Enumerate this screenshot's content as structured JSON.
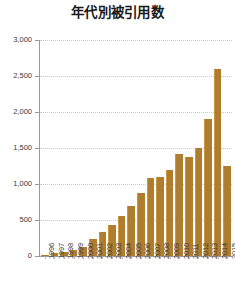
{
  "chart_data": {
    "type": "bar",
    "title": "年代別被引用数",
    "xlabel": "",
    "ylabel": "",
    "categories": [
      "1996",
      "1997",
      "1998",
      "1999",
      "2000",
      "2001",
      "2002",
      "2003",
      "2004",
      "2005",
      "2006",
      "2007",
      "2008",
      "2009",
      "2010",
      "2011",
      "2012",
      "2013",
      "2014",
      "2015"
    ],
    "values": [
      20,
      40,
      60,
      90,
      130,
      230,
      330,
      430,
      560,
      700,
      870,
      1080,
      1100,
      1200,
      1420,
      1380,
      1500,
      1900,
      2600,
      1250
    ],
    "series": [
      {
        "name": "被引用数",
        "values": [
          20,
          40,
          60,
          90,
          130,
          230,
          330,
          430,
          560,
          700,
          870,
          1080,
          1100,
          1200,
          1420,
          1380,
          1500,
          1900,
          2600,
          1250
        ]
      }
    ],
    "ylim": [
      0,
      3000
    ],
    "ytick_values": [
      0,
      500,
      1000,
      1500,
      2000,
      2500,
      3000
    ],
    "ytick_labels": [
      "0",
      "500",
      "1,000",
      "1,500",
      "2,000",
      "2,500",
      "3,000"
    ],
    "grid": true,
    "legend": false,
    "legend_position": "none",
    "bar_color": "#b07d2e",
    "background_color": "#ffffff",
    "gridline_color": "#c9c9c9",
    "axis_color": "#9a9a9a",
    "text_color": "#3a3a3a",
    "title_color": "#1a1a1a"
  }
}
